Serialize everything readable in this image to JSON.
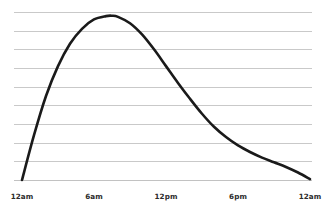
{
  "chart_data": {
    "type": "line",
    "title": "",
    "subtitle": "",
    "xlabel": "",
    "ylabel": "",
    "grid": true,
    "legend": false,
    "legend_position": "none",
    "style": "hand-drawn sketch",
    "line_color": "#1a1a1a",
    "grid_color": "#c9c9c9",
    "axis_color": "#c2c2c2",
    "background_color": "#ffffff",
    "x_tick_labels": [
      "12am",
      "6am",
      "12pm",
      "6pm",
      "12am"
    ],
    "x_tick_hours": [
      0,
      6,
      12,
      18,
      24
    ],
    "xlim": [
      0,
      24
    ],
    "ylim": [
      0,
      9
    ],
    "y_gridline_count": 9,
    "y_tick_labels": [],
    "x": [
      0,
      1,
      2,
      3,
      4,
      5,
      6,
      7,
      7.5,
      8,
      9,
      10,
      11,
      12,
      13,
      14,
      15,
      16,
      17,
      18,
      19,
      20,
      21,
      22,
      23,
      24
    ],
    "values": [
      0.0,
      2.4,
      4.5,
      6.1,
      7.3,
      8.1,
      8.6,
      8.78,
      8.8,
      8.74,
      8.4,
      7.8,
      7.0,
      6.1,
      5.2,
      4.35,
      3.55,
      2.85,
      2.3,
      1.85,
      1.5,
      1.2,
      0.95,
      0.7,
      0.4,
      0.05
    ],
    "annotations": [],
    "peak": {
      "x": 7.5,
      "y": 8.8,
      "label": ""
    }
  },
  "figure": {
    "plot_area": {
      "left": 22,
      "right": 310,
      "top": 12,
      "bottom": 180
    },
    "axis_label_y": 193
  }
}
